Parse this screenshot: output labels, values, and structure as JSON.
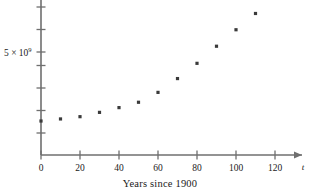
{
  "chart_data": {
    "type": "scatter",
    "title": "",
    "subtitle": "",
    "caption": "Years since 1900",
    "xlabel": "t",
    "ylabel": "",
    "x": [
      0,
      10,
      20,
      30,
      40,
      50,
      60,
      70,
      80,
      90,
      100,
      110
    ],
    "values": [
      1650000000,
      1750000000,
      1860000000,
      2070000000,
      2300000000,
      2560000000,
      3040000000,
      3710000000,
      4450000000,
      5280000000,
      6080000000,
      6870000000
    ],
    "series": [
      {
        "name": "World population",
        "points": [
          {
            "x": 0,
            "y": 1650000000
          },
          {
            "x": 10,
            "y": 1750000000
          },
          {
            "x": 20,
            "y": 1860000000
          },
          {
            "x": 30,
            "y": 2070000000
          },
          {
            "x": 40,
            "y": 2300000000
          },
          {
            "x": 50,
            "y": 2560000000
          },
          {
            "x": 60,
            "y": 3040000000
          },
          {
            "x": 70,
            "y": 3710000000
          },
          {
            "x": 80,
            "y": 4450000000
          },
          {
            "x": 90,
            "y": 5280000000
          },
          {
            "x": 100,
            "y": 6080000000
          },
          {
            "x": 110,
            "y": 6870000000
          }
        ]
      }
    ],
    "x_ticks": [
      0,
      20,
      40,
      60,
      80,
      100,
      120
    ],
    "x_tick_labels": [
      "0",
      "20",
      "40",
      "60",
      "80",
      "100",
      "120"
    ],
    "xlim": [
      0,
      126
    ],
    "y_ticks": [
      1000000000,
      2000000000,
      3000000000,
      4000000000,
      5000000000,
      6000000000,
      7000000000
    ],
    "y_tick_labels": [
      "",
      "",
      "",
      "",
      "5 × 10⁹",
      "",
      ""
    ],
    "y_axis_label_text": "5 × 10",
    "y_axis_label_exponent": "9",
    "ylim": [
      0,
      7700000000
    ],
    "grid": false,
    "legend": false,
    "legend_position": "none",
    "x_axis_arrow": true,
    "y_axis_arrow": false,
    "marker": "square",
    "marker_color": "#3a3a3a",
    "axis_color": "#6f6f6f"
  },
  "figure": {
    "caption": "Years since 1900",
    "x_axis_variable": "t",
    "y_axis_tick_label": "5 × 10⁹"
  }
}
